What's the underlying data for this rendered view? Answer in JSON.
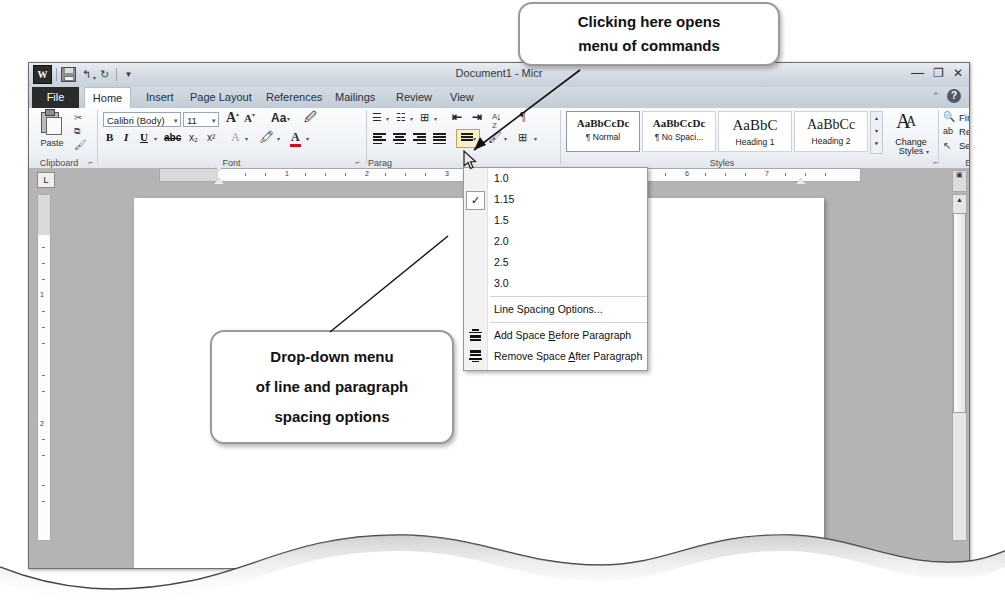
{
  "window": {
    "title": "Document1 - Micr",
    "quick_access": [
      "word-logo",
      "save-icon",
      "undo-icon",
      "redo-icon",
      "customize-qat-icon"
    ],
    "controls": {
      "minimize": "—",
      "restore": "❐",
      "close": "✕"
    },
    "help": {
      "collapse": "⌃",
      "question": "?"
    }
  },
  "tabs": [
    {
      "label": "File",
      "active": false,
      "file": true
    },
    {
      "label": "Home",
      "active": true
    },
    {
      "label": "Insert",
      "active": false
    },
    {
      "label": "Page Layout",
      "active": false
    },
    {
      "label": "References",
      "active": false
    },
    {
      "label": "Mailings",
      "active": false
    },
    {
      "label": "Review",
      "active": false
    },
    {
      "label": "View",
      "active": false
    }
  ],
  "ribbon": {
    "groups": [
      {
        "name": "Clipboard",
        "label": "Clipboard"
      },
      {
        "name": "Font",
        "label": "Font"
      },
      {
        "name": "Paragraph",
        "label": "Paragraph",
        "clipped_label": "Parag"
      },
      {
        "name": "Styles",
        "label": "Styles"
      },
      {
        "name": "Editing",
        "label": "Editing"
      }
    ],
    "clipboard": {
      "paste_label": "Paste",
      "cut": "scissors-icon",
      "copy": "copy-icon",
      "format_painter": "format-painter-icon"
    },
    "font": {
      "font_name": "Calibri (Body)",
      "font_size": "11",
      "grow_font": "A",
      "shrink_font": "A",
      "change_case": "Aa",
      "clear_formatting": "clear-formatting-icon",
      "bold": "B",
      "italic": "I",
      "underline": "U",
      "strikethrough": "abc",
      "subscript": "x₂",
      "superscript": "x²",
      "text_effects": "A",
      "highlight": "highlight-icon",
      "font_color": "A"
    },
    "paragraph": {
      "bullets": "bullet-list-icon",
      "numbering": "numbered-list-icon",
      "multilevel": "multilevel-list-icon",
      "decrease_indent": "decrease-indent-icon",
      "increase_indent": "increase-indent-icon",
      "sort": "sort-icon",
      "show_marks": "¶",
      "align_left": "align-left-icon",
      "align_center": "align-center-icon",
      "align_right": "align-right-icon",
      "justify": "justify-icon",
      "line_spacing": "line-spacing-icon",
      "shading": "shading-icon",
      "borders": "borders-icon"
    },
    "styles": {
      "items": [
        {
          "preview": "AaBbCcDc",
          "name": "¶ Normal",
          "selected": true,
          "size": "11px"
        },
        {
          "preview": "AaBbCcDc",
          "name": "¶ No Spaci...",
          "selected": false,
          "size": "11px"
        },
        {
          "preview": "AaBbC",
          "name": "Heading 1",
          "selected": false,
          "size": "15px"
        },
        {
          "preview": "AaBbCc",
          "name": "Heading 2",
          "selected": false,
          "size": "14px"
        }
      ],
      "change_styles_label_1": "Change",
      "change_styles_label_2": "Styles"
    },
    "editing": {
      "find": "Find",
      "replace": "Replace",
      "select": "Select"
    }
  },
  "line_spacing_menu": {
    "items": [
      {
        "label": "1.0",
        "checked": false,
        "icon": null
      },
      {
        "label": "1.15",
        "checked": true,
        "icon": null
      },
      {
        "label": "1.5",
        "checked": false,
        "icon": null
      },
      {
        "label": "2.0",
        "checked": false,
        "icon": null
      },
      {
        "label": "2.5",
        "checked": false,
        "icon": null
      },
      {
        "label": "3.0",
        "checked": false,
        "icon": null
      },
      {
        "label": "Line Spacing Options...",
        "checked": false,
        "icon": null,
        "separator_before": true
      },
      {
        "label": "Add Space Before Paragraph",
        "checked": false,
        "icon": "space-before-icon",
        "separator_before": true,
        "accel": "B"
      },
      {
        "label": "Remove Space After Paragraph",
        "checked": false,
        "icon": "space-after-icon",
        "accel": "A"
      }
    ]
  },
  "ruler": {
    "horizontal_numbers": [
      "1",
      "2",
      "3",
      "4",
      "5",
      "6",
      "7"
    ],
    "vertical_numbers": [
      "1",
      "2"
    ],
    "tab_selector": "L"
  },
  "callouts": {
    "top": {
      "line1": "Clicking here opens",
      "line2": "menu of commands"
    },
    "bottom": {
      "line1": "Drop-down menu",
      "line2": "of line and paragraph",
      "line3": "spacing options"
    }
  },
  "colors": {
    "window_bg": "#c9c9c9",
    "doc_bg": "#b4b4b4",
    "page": "#ffffff",
    "ribbon_top": "#fbfcfd",
    "file_tab": "#2b2b2b",
    "callout_border": "#9a9a9a",
    "menu_border": "#9a9a9a"
  }
}
